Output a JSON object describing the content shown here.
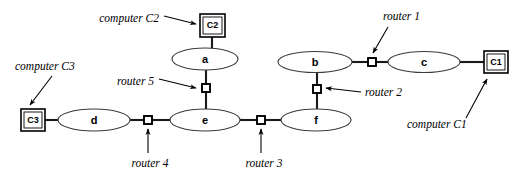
{
  "diagram": {
    "colors": {
      "background": "#ffffff",
      "stroke": "#000000",
      "link": "#1a1a1a",
      "ellipse_stroke": "#3a3a3a"
    },
    "networks": [
      {
        "id": "net-a",
        "label": "a",
        "cx": 205,
        "cy": 59,
        "rx": 33,
        "ry": 11
      },
      {
        "id": "net-b",
        "label": "b",
        "cx": 315,
        "cy": 62,
        "rx": 37,
        "ry": 10.5
      },
      {
        "id": "net-c",
        "label": "c",
        "cx": 424,
        "cy": 62,
        "rx": 36,
        "ry": 10.5
      },
      {
        "id": "net-d",
        "label": "d",
        "cx": 94,
        "cy": 120,
        "rx": 36,
        "ry": 11
      },
      {
        "id": "net-e",
        "label": "e",
        "cx": 205,
        "cy": 120,
        "rx": 35,
        "ry": 11
      },
      {
        "id": "net-f",
        "label": "f",
        "cx": 316,
        "cy": 120,
        "rx": 35,
        "ry": 11
      }
    ],
    "computers": [
      {
        "id": "host-c2",
        "label": "C2",
        "x": 200,
        "y": 14,
        "w": 25,
        "h": 23
      },
      {
        "id": "host-c1",
        "label": "C1",
        "x": 484,
        "y": 51,
        "w": 24,
        "h": 22
      },
      {
        "id": "host-c3",
        "label": "C3",
        "x": 21,
        "y": 109,
        "w": 24,
        "h": 22
      }
    ],
    "routers": [
      {
        "id": "router-1",
        "label": "router 1",
        "cx": 372,
        "cy": 62,
        "size": 8
      },
      {
        "id": "router-2",
        "label": "router 2",
        "cx": 317,
        "cy": 89,
        "size": 8
      },
      {
        "id": "router-3",
        "label": "router 3",
        "cx": 261,
        "cy": 120,
        "size": 8
      },
      {
        "id": "router-4",
        "label": "router 4",
        "cx": 148,
        "cy": 120,
        "size": 8
      },
      {
        "id": "router-5",
        "label": "router 5",
        "cx": 206,
        "cy": 88,
        "size": 8
      }
    ],
    "annotations": [
      {
        "id": "anno-computer-c2",
        "text": "computer C2",
        "x": 159,
        "y": 22,
        "anchor": "end"
      },
      {
        "id": "anno-computer-c3",
        "text": "computer C3",
        "x": 15,
        "y": 70,
        "anchor": "start"
      },
      {
        "id": "anno-computer-c1",
        "text": "computer C1",
        "x": 407,
        "y": 128,
        "anchor": "start"
      },
      {
        "id": "anno-router-1",
        "text": "router 1",
        "x": 383,
        "y": 20,
        "anchor": "start"
      },
      {
        "id": "anno-router-2",
        "text": "router 2",
        "x": 365,
        "y": 96,
        "anchor": "start"
      },
      {
        "id": "anno-router-3",
        "text": "router 3",
        "x": 264,
        "y": 167,
        "anchor": "middle"
      },
      {
        "id": "anno-router-4",
        "text": "router 4",
        "x": 150,
        "y": 167,
        "anchor": "middle"
      },
      {
        "id": "anno-router-5",
        "text": "router 5",
        "x": 154,
        "y": 85,
        "anchor": "end"
      }
    ],
    "links": [
      {
        "id": "link-c2-a",
        "from": "host-c2",
        "to": "net-a"
      },
      {
        "id": "link-a-router5",
        "from": "net-a",
        "to": "router-5"
      },
      {
        "id": "link-router5-e",
        "from": "router-5",
        "to": "net-e"
      },
      {
        "id": "link-c3-d",
        "from": "host-c3",
        "to": "net-d"
      },
      {
        "id": "link-d-router4",
        "from": "net-d",
        "to": "router-4"
      },
      {
        "id": "link-router4-e",
        "from": "router-4",
        "to": "net-e"
      },
      {
        "id": "link-e-router3",
        "from": "net-e",
        "to": "router-3"
      },
      {
        "id": "link-router3-f",
        "from": "router-3",
        "to": "net-f"
      },
      {
        "id": "link-f-router2",
        "from": "net-f",
        "to": "router-2"
      },
      {
        "id": "link-router2-b",
        "from": "router-2",
        "to": "net-b"
      },
      {
        "id": "link-b-router1",
        "from": "net-b",
        "to": "router-1"
      },
      {
        "id": "link-router1-c",
        "from": "router-1",
        "to": "net-c"
      },
      {
        "id": "link-c-c1",
        "from": "net-c",
        "to": "host-c1"
      }
    ]
  }
}
